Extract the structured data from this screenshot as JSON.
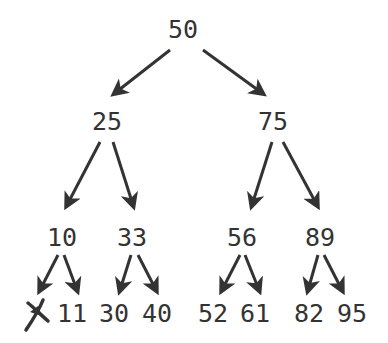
{
  "diagram": {
    "type": "binary-search-tree",
    "colors": {
      "text": "#333333",
      "arrow": "#333333",
      "background": "#ffffff"
    },
    "nodes": {
      "root": {
        "label": "50",
        "x": 183,
        "y": 29
      },
      "n25": {
        "label": "25",
        "x": 107,
        "y": 121
      },
      "n75": {
        "label": "75",
        "x": 273,
        "y": 121
      },
      "n10": {
        "label": "10",
        "x": 62,
        "y": 237
      },
      "n33": {
        "label": "33",
        "x": 132,
        "y": 237
      },
      "n56": {
        "label": "56",
        "x": 242,
        "y": 237
      },
      "n89": {
        "label": "89",
        "x": 320,
        "y": 237
      },
      "null_leaf": {
        "label": "",
        "symbol": "crossed-out-null",
        "x": 37,
        "y": 313
      },
      "n11": {
        "label": "11",
        "x": 72,
        "y": 313
      },
      "n30": {
        "label": "30",
        "x": 114,
        "y": 313
      },
      "n40": {
        "label": "40",
        "x": 157,
        "y": 313
      },
      "n52": {
        "label": "52",
        "x": 213,
        "y": 313
      },
      "n61": {
        "label": "61",
        "x": 255,
        "y": 313
      },
      "n82": {
        "label": "82",
        "x": 309,
        "y": 313
      },
      "n95": {
        "label": "95",
        "x": 352,
        "y": 313
      }
    },
    "edges": [
      {
        "from": "50",
        "to": "25",
        "x1": 170,
        "y1": 50,
        "x2": 115,
        "y2": 93
      },
      {
        "from": "50",
        "to": "75",
        "x1": 203,
        "y1": 50,
        "x2": 262,
        "y2": 93
      },
      {
        "from": "25",
        "to": "10",
        "x1": 100,
        "y1": 142,
        "x2": 67,
        "y2": 205
      },
      {
        "from": "25",
        "to": "33",
        "x1": 113,
        "y1": 142,
        "x2": 133,
        "y2": 205
      },
      {
        "from": "75",
        "to": "56",
        "x1": 272,
        "y1": 142,
        "x2": 252,
        "y2": 205
      },
      {
        "from": "75",
        "to": "89",
        "x1": 283,
        "y1": 142,
        "x2": 317,
        "y2": 205
      },
      {
        "from": "10",
        "to": "null",
        "x1": 58,
        "y1": 255,
        "x2": 40,
        "y2": 290
      },
      {
        "from": "10",
        "to": "11",
        "x1": 64,
        "y1": 255,
        "x2": 77,
        "y2": 290
      },
      {
        "from": "33",
        "to": "30",
        "x1": 131,
        "y1": 255,
        "x2": 120,
        "y2": 290
      },
      {
        "from": "33",
        "to": "40",
        "x1": 138,
        "y1": 255,
        "x2": 156,
        "y2": 290
      },
      {
        "from": "56",
        "to": "52",
        "x1": 240,
        "y1": 255,
        "x2": 222,
        "y2": 290
      },
      {
        "from": "56",
        "to": "61",
        "x1": 245,
        "y1": 255,
        "x2": 259,
        "y2": 290
      },
      {
        "from": "89",
        "to": "82",
        "x1": 318,
        "y1": 255,
        "x2": 308,
        "y2": 290
      },
      {
        "from": "89",
        "to": "95",
        "x1": 324,
        "y1": 255,
        "x2": 342,
        "y2": 290
      }
    ]
  }
}
